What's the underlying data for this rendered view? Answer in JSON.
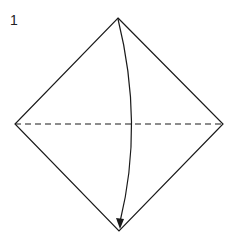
{
  "diagram": {
    "step_number": "1",
    "colors": {
      "line": "#1a1a1a",
      "background": "#ffffff"
    },
    "square": {
      "top": [
        118,
        18
      ],
      "right": [
        223,
        124
      ],
      "bottom": [
        119,
        231
      ],
      "left": [
        15,
        124
      ]
    },
    "valley_fold_line": {
      "from": [
        15,
        124
      ],
      "to": [
        223,
        124
      ],
      "style": "dashed"
    },
    "fold_arrow": {
      "from": [
        118,
        19
      ],
      "to": [
        120,
        228
      ],
      "direction": "top-to-bottom",
      "curve": "bulges-right"
    }
  }
}
